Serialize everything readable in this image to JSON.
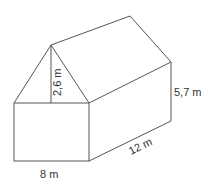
{
  "diagram": {
    "type": "3d-prism-house",
    "labels": {
      "roof_height": "2,6 m",
      "wall_height": "5,7 m",
      "width": "8 m",
      "length": "12 m"
    },
    "colors": {
      "stroke": "#555555",
      "text": "#333333",
      "background": "#ffffff"
    }
  }
}
